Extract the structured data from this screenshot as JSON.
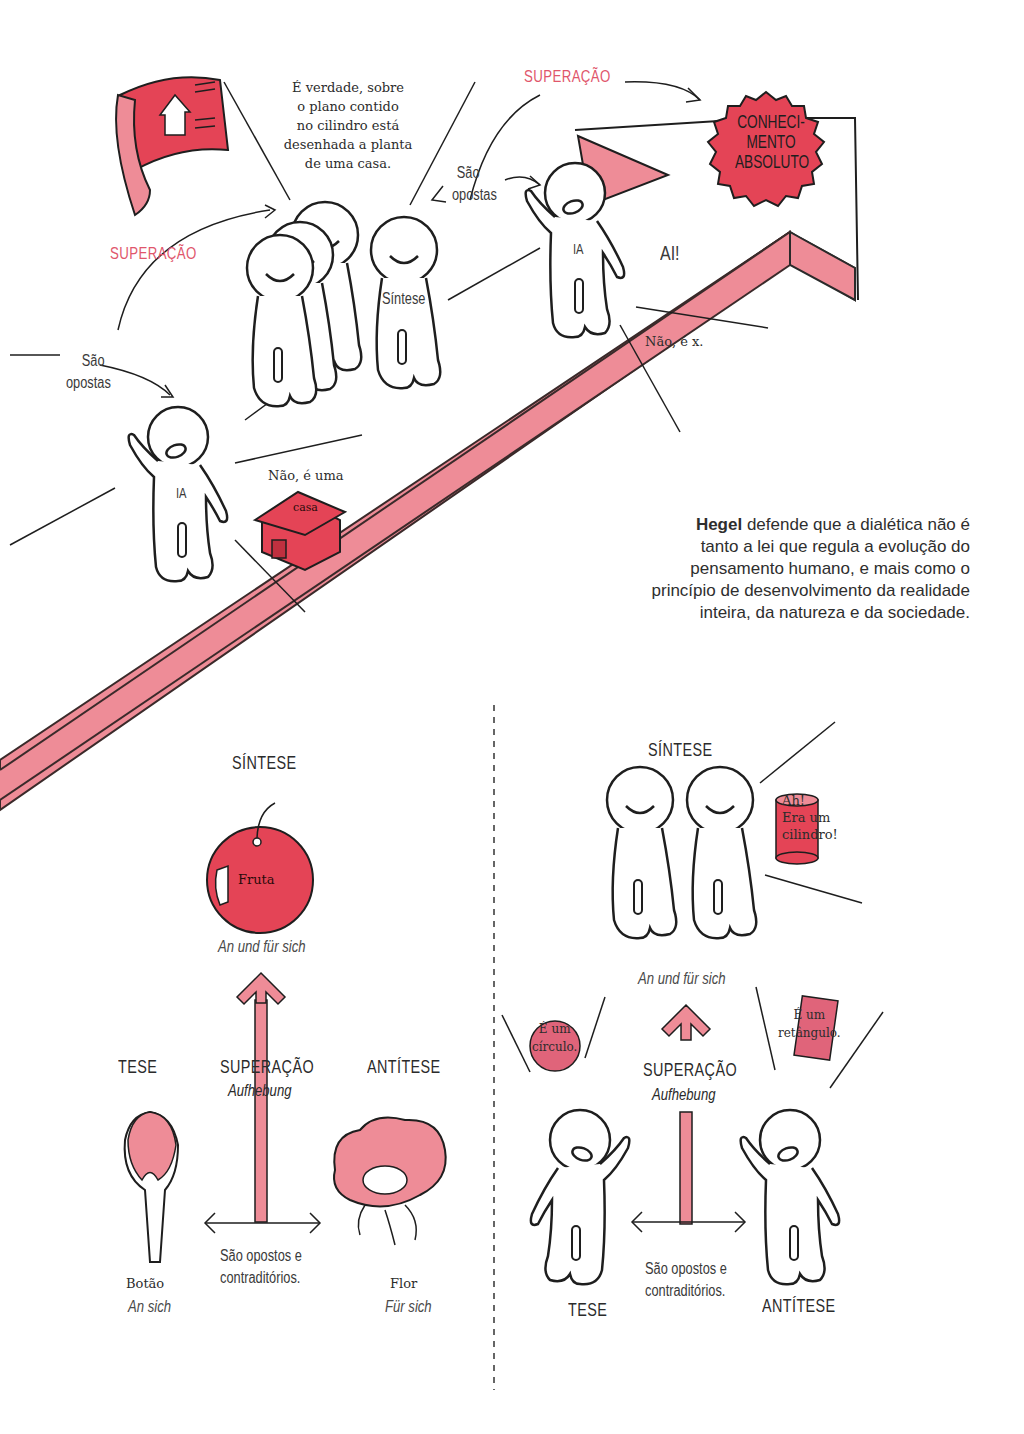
{
  "colors": {
    "pink_band": "#ee8c97",
    "red_fill": "#e44456",
    "accent_text": "#e0566b",
    "ink": "#1e1e1e"
  },
  "top_scene": {
    "superacao_1": "SUPERAÇÃO",
    "superacao_2": "SUPERAÇÃO",
    "sao_opostas_1": [
      "São",
      "opostas"
    ],
    "sao_opostas_2": [
      "São",
      "opostas"
    ],
    "speech_blueprint": [
      "É verdade, sobre",
      "o plano contido",
      "no cilindro está",
      "desenhada a planta",
      "de uma casa."
    ],
    "sintese_shirt": "Síntese",
    "ia_shirt_1": "IA",
    "ia_shirt_2": "IA",
    "ai_exclaim": "AI!",
    "nao_e_x": "Não, é x.",
    "nao_e_uma": "Não, é uma",
    "casa": "casa",
    "burst": [
      "CONHECI-",
      "MENTO",
      "ABSOLUTO"
    ]
  },
  "caption": {
    "bold": "Hegel",
    "lines": [
      " defende que a dialética não é",
      "tanto a lei que regula a evolução do",
      "pensamento humano, e mais como o",
      "princípio de desenvolvimento da realidade",
      "inteira, da natureza e da sociedade."
    ]
  },
  "left_diagram": {
    "sintese": "SÍNTESE",
    "fruta": "Fruta",
    "an_und_fur_sich": "An und für sich",
    "tese": "TESE",
    "superacao": "SUPERAÇÃO",
    "aufhebung": "Aufhebung",
    "antitese": "ANTÍTESE",
    "opostos": [
      "São opostos e",
      "contraditórios."
    ],
    "botao": "Botão",
    "an_sich": "An sich",
    "flor": "Flor",
    "fur_sich": "Für sich"
  },
  "right_diagram": {
    "sintese": "SÍNTESE",
    "cilindro": [
      "Ah!",
      "Era um",
      "cilindro!"
    ],
    "an_und_fur_sich": "An und für sich",
    "circulo": [
      "É um",
      "círculo."
    ],
    "retangulo": [
      "É um",
      "retângulo."
    ],
    "superacao": "SUPERAÇÃO",
    "aufhebung": "Aufhebung",
    "opostos": [
      "São opostos e",
      "contraditórios."
    ],
    "tese": "TESE",
    "antitese": "ANTÍTESE"
  }
}
